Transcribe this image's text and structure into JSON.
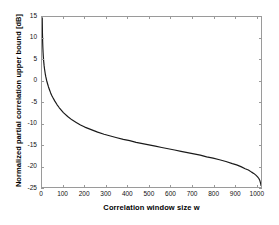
{
  "chart_data": {
    "type": "line",
    "title": "",
    "xlabel": "Correlation window size w",
    "ylabel": "Normalized partial correlation upper bound [dB]",
    "xlim": [
      0,
      1024
    ],
    "ylim": [
      -25,
      15
    ],
    "xticks": [
      0,
      100,
      200,
      300,
      400,
      500,
      600,
      700,
      800,
      900,
      1000
    ],
    "yticks": [
      15,
      10,
      5,
      0,
      -5,
      -10,
      -15,
      -20,
      -25
    ],
    "grid": false,
    "legend": null,
    "series": [
      {
        "name": "Normalized partial correlation upper bound",
        "color": "#1a1a1a",
        "linewidth": 1.2,
        "x": [
          1,
          2,
          3,
          4,
          5,
          6,
          8,
          10,
          12,
          15,
          18,
          22,
          26,
          30,
          35,
          40,
          45,
          50,
          60,
          70,
          80,
          90,
          100,
          120,
          140,
          160,
          180,
          200,
          230,
          260,
          290,
          320,
          350,
          380,
          410,
          440,
          470,
          500,
          530,
          560,
          590,
          620,
          650,
          680,
          710,
          740,
          770,
          800,
          830,
          860,
          890,
          910,
          930,
          950,
          965,
          980,
          990,
          1000,
          1008,
          1014,
          1018,
          1021,
          1023,
          1024
        ],
        "y": [
          14.8,
          11.3,
          9.2,
          7.8,
          6.7,
          5.8,
          4.5,
          3.5,
          2.7,
          1.7,
          0.9,
          0.0,
          -0.7,
          -1.4,
          -2.1,
          -2.8,
          -3.4,
          -3.9,
          -4.8,
          -5.6,
          -6.3,
          -6.9,
          -7.5,
          -8.4,
          -9.2,
          -9.8,
          -10.4,
          -10.9,
          -11.5,
          -12.1,
          -12.6,
          -13.0,
          -13.4,
          -13.8,
          -14.1,
          -14.5,
          -14.8,
          -15.1,
          -15.4,
          -15.7,
          -16.0,
          -16.3,
          -16.6,
          -16.9,
          -17.2,
          -17.5,
          -17.9,
          -18.2,
          -18.6,
          -19.0,
          -19.5,
          -19.8,
          -20.2,
          -20.7,
          -21.0,
          -21.5,
          -21.8,
          -22.2,
          -22.6,
          -23.0,
          -23.4,
          -23.9,
          -24.3,
          -24.6
        ]
      }
    ]
  },
  "axes": {
    "xlabel": "Correlation window size w",
    "ylabel": "Normalized partial correlation upper bound [dB]",
    "xtick_labels": [
      "0",
      "100",
      "200",
      "300",
      "400",
      "500",
      "600",
      "700",
      "800",
      "900",
      "1000"
    ],
    "ytick_labels": [
      "15",
      "10",
      "5",
      "0",
      "-5",
      "-10",
      "-15",
      "-20",
      "-25"
    ]
  }
}
